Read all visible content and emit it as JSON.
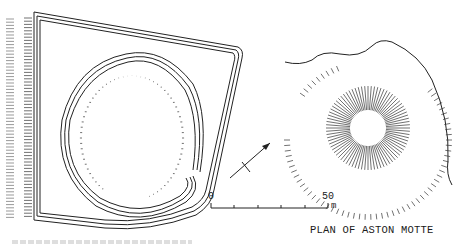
{
  "figure": {
    "title": "PLAN OF ASTON MOTTE",
    "scale_bar": {
      "start_label": "0",
      "end_label": "50",
      "unit": "m",
      "divisions": 5
    },
    "north_arrow": "north-arrow",
    "features": [
      "bailey-enclosure",
      "inner-ringwork",
      "motte-mound",
      "outer-ditch-hachures",
      "field-boundary-line"
    ],
    "bottom_left_caption": "",
    "colors": {
      "ink": "#222222",
      "background": "#ffffff"
    }
  }
}
